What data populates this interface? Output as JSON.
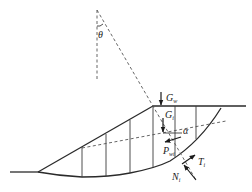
{
  "diagram": {
    "colors": {
      "line": "#2a2a2a",
      "dashed": "#555555",
      "background": "#ffffff"
    },
    "labels": {
      "theta": "θ",
      "G_w_main": "G",
      "G_w_sub": "w",
      "G_i_main": "G",
      "G_i_sub": "i",
      "alpha": "α",
      "P_wi_main": "P",
      "P_wi_sub": "wi",
      "T_i_main": "T",
      "T_i_sub": "i",
      "N_i_main": "N",
      "N_i_sub": "i"
    },
    "elements": {
      "ground_surface": "slope profile with toe and crest",
      "slip_surface": "circular arc slip surface",
      "phreatic_line": "dashed seepage / water table line",
      "slice_count": 6
    }
  }
}
